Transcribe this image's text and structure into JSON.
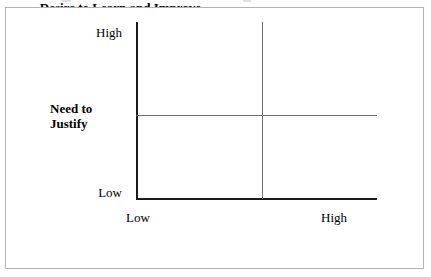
{
  "figure": {
    "background_color": "#ffffff",
    "frame_color": "#b3b3b3",
    "axis_color": "#1a1a1a",
    "divider_color": "#6e6e6e"
  },
  "chart_data": {
    "type": "scatter",
    "title": "",
    "subtitle": "",
    "xlabel": "Desire to Learn and Improve",
    "ylabel": "Need to Justify",
    "x_tick_labels": [
      "Low",
      "High"
    ],
    "y_tick_labels": [
      "Low",
      "High"
    ],
    "xlim": [
      "Low",
      "High"
    ],
    "ylim": [
      "Low",
      "High"
    ],
    "grid": false,
    "legend": null,
    "series": [],
    "values": [],
    "annotations": [],
    "quadrant_dividers": {
      "vertical": 1,
      "horizontal": 1
    }
  },
  "axes": {
    "y": {
      "title_line1": "Need to",
      "title_line2": "Justify",
      "tick_high": "High",
      "tick_low": "Low"
    },
    "x": {
      "title": "Desire to Learn and Improve",
      "tick_low": "Low",
      "tick_high": "High"
    }
  }
}
